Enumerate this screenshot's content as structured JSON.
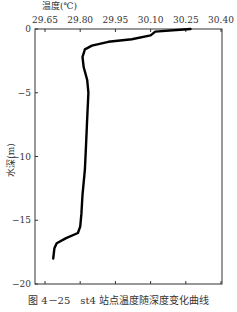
{
  "chart_data": {
    "type": "line",
    "title": "",
    "xlabel": "温度(℃)",
    "ylabel": "水深(m)",
    "x_axis_position": "top",
    "xlim": [
      29.6,
      30.4
    ],
    "ylim": [
      -20,
      0
    ],
    "xticks": [
      "29.65",
      "29.80",
      "29.95",
      "30.10",
      "30.25",
      "30.40"
    ],
    "xtick_values": [
      29.65,
      29.8,
      29.95,
      30.1,
      30.25,
      30.4
    ],
    "yticks": [
      "0",
      "-5",
      "-10",
      "-15",
      "-20"
    ],
    "ytick_values": [
      0,
      -5,
      -10,
      -15,
      -20
    ],
    "grid": false,
    "legend": null,
    "series": [
      {
        "name": "st4",
        "points": [
          [
            30.27,
            0.0
          ],
          [
            30.12,
            -0.2
          ],
          [
            30.1,
            -0.5
          ],
          [
            30.02,
            -0.8
          ],
          [
            29.92,
            -1.0
          ],
          [
            29.85,
            -1.3
          ],
          [
            29.82,
            -1.6
          ],
          [
            29.81,
            -2.2
          ],
          [
            29.815,
            -3.0
          ],
          [
            29.83,
            -4.0
          ],
          [
            29.835,
            -5.0
          ],
          [
            29.83,
            -7.0
          ],
          [
            29.825,
            -9.0
          ],
          [
            29.82,
            -11.0
          ],
          [
            29.81,
            -13.0
          ],
          [
            29.805,
            -14.5
          ],
          [
            29.8,
            -15.5
          ],
          [
            29.79,
            -16.0
          ],
          [
            29.74,
            -16.4
          ],
          [
            29.7,
            -16.8
          ],
          [
            29.69,
            -17.2
          ],
          [
            29.685,
            -18.0
          ]
        ]
      }
    ]
  },
  "caption": "图 4－25　st4 站点温度随深度变化曲线"
}
